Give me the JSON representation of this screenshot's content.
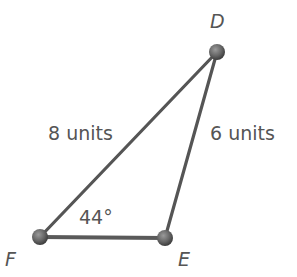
{
  "diagram": {
    "type": "triangle",
    "vertices": [
      {
        "name": "D",
        "label": "D"
      },
      {
        "name": "E",
        "label": "E"
      },
      {
        "name": "F",
        "label": "F"
      }
    ],
    "sides": {
      "FD": {
        "label": "8 units",
        "length": 8
      },
      "DE": {
        "label": "6 units",
        "length": 6
      }
    },
    "angles": {
      "F": {
        "label": "44°",
        "value": 44
      }
    },
    "colors": {
      "line": "#555555",
      "vertex_fill": "#6e6e6e",
      "text": "#555555"
    }
  }
}
